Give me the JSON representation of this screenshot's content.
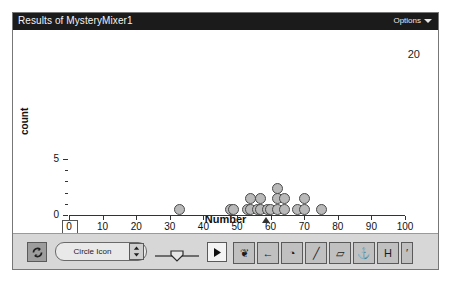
{
  "window": {
    "title": "Results of MysteryMixer1",
    "options_label": "Options",
    "options_caret_icon": "chevron-down-icon"
  },
  "plot": {
    "count_badge": "20",
    "zero_label": "0"
  },
  "toolbar": {
    "refresh_icon": "refresh-icon",
    "icon_select_value": "Circle Icon",
    "stepper_icon": "stepper-updown-icon",
    "slider_handle_icon": "shield-handle-icon",
    "cursor_icon": "arrow-cursor-icon",
    "tools": [
      {
        "name": "hand-tool",
        "glyph": "❦"
      },
      {
        "name": "arrow-left-tool",
        "glyph": "←"
      },
      {
        "name": "stamp-tool",
        "glyph": "◔"
      },
      {
        "name": "pencil-tool",
        "glyph": "╱"
      },
      {
        "name": "eraser-tool",
        "glyph": "▱"
      },
      {
        "name": "brush-tool",
        "glyph": "⚓"
      },
      {
        "name": "text-tool",
        "glyph": "H"
      }
    ],
    "extra_tool": {
      "name": "more-tools",
      "glyph": "′"
    }
  },
  "chart_data": {
    "type": "scatter",
    "plot_style": "dotplot",
    "title": "Results of MysteryMixer1",
    "xlabel": "Number",
    "ylabel": "count",
    "xlim": [
      0,
      100
    ],
    "ylim": [
      0,
      7
    ],
    "xticks": [
      0,
      10,
      20,
      30,
      40,
      50,
      60,
      70,
      80,
      90,
      100
    ],
    "xticklabels": [
      "0",
      "10",
      "20",
      "30",
      "40",
      "50",
      "60",
      "70",
      "80",
      "90",
      "100"
    ],
    "yticks": [
      0,
      5
    ],
    "yticklabels": [
      "0",
      "5"
    ],
    "y_minor_ticks": [
      1,
      2,
      3,
      4
    ],
    "grid": false,
    "legend": false,
    "n_points": 20,
    "mean_marker_value": 58.5,
    "values": [
      33,
      48,
      49,
      53,
      54,
      55,
      56,
      57,
      58,
      59,
      60,
      62,
      62,
      62,
      63,
      64,
      68,
      69,
      70,
      75
    ],
    "stacks": [
      {
        "value": 33,
        "count": 1
      },
      {
        "value": 48,
        "count": 1
      },
      {
        "value": 49,
        "count": 1
      },
      {
        "value": 53,
        "count": 1
      },
      {
        "value": 54,
        "count": 2
      },
      {
        "value": 56,
        "count": 1
      },
      {
        "value": 57,
        "count": 2
      },
      {
        "value": 59,
        "count": 1
      },
      {
        "value": 60,
        "count": 1
      },
      {
        "value": 62,
        "count": 3
      },
      {
        "value": 64,
        "count": 2
      },
      {
        "value": 68,
        "count": 1
      },
      {
        "value": 70,
        "count": 2
      },
      {
        "value": 75,
        "count": 1
      }
    ]
  }
}
